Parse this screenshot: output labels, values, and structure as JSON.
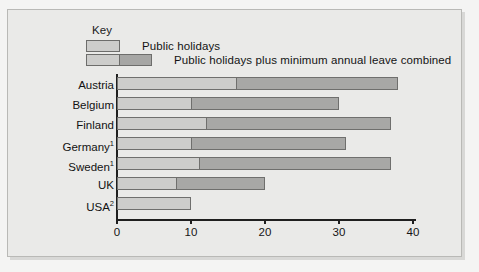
{
  "legend": {
    "title": "Key",
    "items": [
      {
        "label": "Public holidays",
        "color": "#cdcdcb"
      },
      {
        "label": "Public holidays plus minimum annual leave combined",
        "color": "#a8a8a6"
      }
    ]
  },
  "axis": {
    "ticks": [
      "0",
      "10",
      "20",
      "30",
      "40"
    ]
  },
  "categories": [
    {
      "name": "Austria",
      "note": ""
    },
    {
      "name": "Belgium",
      "note": ""
    },
    {
      "name": "Finland",
      "note": ""
    },
    {
      "name": "Germany",
      "note": "1"
    },
    {
      "name": "Sweden",
      "note": "1"
    },
    {
      "name": "UK",
      "note": ""
    },
    {
      "name": "USA",
      "note": "2"
    }
  ],
  "chart_data": {
    "type": "bar",
    "orientation": "horizontal",
    "stacked": true,
    "title": "",
    "xlabel": "",
    "ylabel": "",
    "xlim": [
      0,
      40
    ],
    "xticks": [
      0,
      10,
      20,
      30,
      40
    ],
    "grid": false,
    "legend_position": "top-left",
    "categories": [
      "Austria",
      "Belgium",
      "Finland",
      "Germany¹",
      "Sweden¹",
      "UK",
      "USA²"
    ],
    "series": [
      {
        "name": "Public holidays",
        "color": "#cdcdcb",
        "values": [
          16,
          10,
          12,
          10,
          11,
          8,
          10
        ]
      },
      {
        "name": "Public holidays plus minimum annual leave combined",
        "color": "#a8a8a6",
        "values": [
          38,
          30,
          37,
          31,
          37,
          20,
          10
        ]
      }
    ]
  }
}
